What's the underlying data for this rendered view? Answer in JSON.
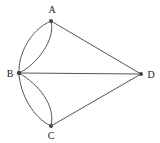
{
  "diagram": {
    "type": "multigraph",
    "colors": {
      "edge": "#555555",
      "node": "#444444",
      "label": "#222222",
      "background": "#ffffff"
    },
    "nodes": [
      {
        "id": "A",
        "label": "A",
        "x": 51,
        "y": 21,
        "lx": 52,
        "ly": 13
      },
      {
        "id": "B",
        "label": "B",
        "x": 19,
        "y": 73,
        "lx": 10,
        "ly": 76
      },
      {
        "id": "C",
        "label": "C",
        "x": 51,
        "y": 126,
        "lx": 51,
        "ly": 138
      },
      {
        "id": "D",
        "label": "D",
        "x": 141,
        "y": 74,
        "lx": 151,
        "ly": 77
      }
    ],
    "edges": [
      {
        "id": "A-B-1",
        "from": "A",
        "to": "B",
        "shape": "curve-outer"
      },
      {
        "id": "A-B-2",
        "from": "A",
        "to": "B",
        "shape": "curve-inner"
      },
      {
        "id": "B-C-1",
        "from": "B",
        "to": "C",
        "shape": "curve-outer"
      },
      {
        "id": "B-C-2",
        "from": "B",
        "to": "C",
        "shape": "curve-inner"
      },
      {
        "id": "A-D",
        "from": "A",
        "to": "D",
        "shape": "straight"
      },
      {
        "id": "B-D",
        "from": "B",
        "to": "D",
        "shape": "straight"
      },
      {
        "id": "C-D",
        "from": "C",
        "to": "D",
        "shape": "straight"
      }
    ]
  }
}
